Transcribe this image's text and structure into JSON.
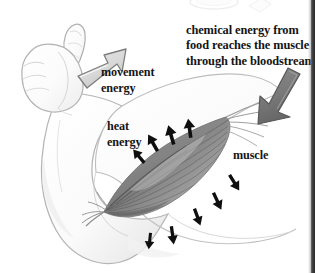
{
  "diagram": {
    "background_color": "#ffffff",
    "text_color": "#141414"
  },
  "labels": {
    "chemical_energy": "chemical energy from\nfood reaches the muscle\nthrough the bloodstream",
    "movement_energy": "movement\nenergy",
    "heat_energy": "heat\nenergy",
    "muscle": "muscle"
  },
  "arrows": {
    "movement": {
      "name": "movement-energy-arrow",
      "direction": "up-right",
      "fill": "#dcdcdc",
      "stroke": "#6e6e6e",
      "meaning": "movement energy leaves the arm"
    },
    "chemical": {
      "name": "chemical-energy-arrow",
      "direction": "down-left",
      "fill": "#7a7a7a",
      "stroke": "#5a5a5a",
      "meaning": "chemical energy enters the muscle"
    },
    "heat": {
      "name": "heat-energy-arrows",
      "color": "#101010",
      "count": 9,
      "meaning": "heat energy radiates away from the muscle"
    }
  },
  "anatomy": {
    "hand": "closed fist with thumb raised",
    "forearm": "forearm outline",
    "upper_arm": "upper arm outline",
    "muscle": "biceps brachii with striations and tendons",
    "skin_fill": "#fdfdfd",
    "skin_stroke": "#b9b9b9",
    "muscle_dark": "#6f6f6f",
    "muscle_light": "#cfcfcf"
  },
  "page": {
    "right_edge_color": "#2b2b2b",
    "top_fragment": "faint cut-off illustration of food on a plate"
  }
}
